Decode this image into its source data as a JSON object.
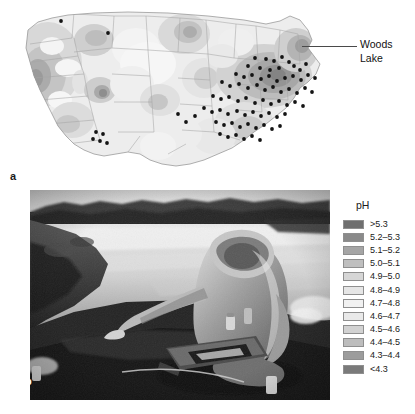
{
  "figure": {
    "panels": [
      {
        "id": "a",
        "label": "a",
        "kind": "map"
      },
      {
        "id": "b",
        "label": "b",
        "kind": "photograph"
      }
    ]
  },
  "map": {
    "title": "",
    "region": "Contiguous United States",
    "annotation": {
      "text": "Woods\nLake",
      "leader": "line"
    },
    "site_marker_color": "#111111",
    "outline_color": "#9a9a9a",
    "state_border_color": "#aaaaaa"
  },
  "photo": {
    "alt": "Researcher kneeling at a lake shore sampling water with a field kit",
    "label": "b"
  },
  "legend": {
    "title": "pH",
    "entries": [
      {
        "label": ">5.3",
        "color": "#6f6f6f"
      },
      {
        "label": "5.2–5.3",
        "color": "#8a8a8a"
      },
      {
        "label": "5.1–5.2",
        "color": "#a5a5a5"
      },
      {
        "label": "5.0–5.1",
        "color": "#bfbfbf"
      },
      {
        "label": "4.9–5.0",
        "color": "#d6d6d6"
      },
      {
        "label": "4.8–4.9",
        "color": "#e6e6e6"
      },
      {
        "label": "4.7–4.8",
        "color": "#f1f1f1"
      },
      {
        "label": "4.6–4.7",
        "color": "#e9e9e9"
      },
      {
        "label": "4.5–4.6",
        "color": "#d2d2d2"
      },
      {
        "label": "4.4–4.5",
        "color": "#bdbdbd"
      },
      {
        "label": "4.3–4.4",
        "color": "#9c9c9c"
      },
      {
        "label": "<4.3",
        "color": "#7a7a7a"
      }
    ]
  },
  "chart_data": {
    "type": "heatmap",
    "title": "",
    "subtitle": "",
    "xlabel": "",
    "ylabel": "",
    "variable": "pH",
    "units": "pH units",
    "legend_position": "right",
    "grid": false,
    "class_breaks": [
      ">5.3",
      "5.2-5.3",
      "5.1-5.2",
      "5.0-5.1",
      "4.9-5.0",
      "4.8-4.9",
      "4.7-4.8",
      "4.6-4.7",
      "4.5-4.6",
      "4.4-4.5",
      "4.3-4.4",
      "<4.3"
    ],
    "class_colors": [
      "#6f6f6f",
      "#8a8a8a",
      "#a5a5a5",
      "#bfbfbf",
      "#d6d6d6",
      "#e6e6e6",
      "#f1f1f1",
      "#e9e9e9",
      "#d2d2d2",
      "#bdbdbd",
      "#9c9c9c",
      "#7a7a7a"
    ],
    "annotations": [
      {
        "text": "Woods Lake",
        "x": 268,
        "y": 50
      }
    ],
    "site_points": [
      [
        53,
        17
      ],
      [
        100,
        29
      ],
      [
        247,
        54
      ],
      [
        258,
        55
      ],
      [
        266,
        57
      ],
      [
        274,
        53
      ],
      [
        281,
        58
      ],
      [
        240,
        62
      ],
      [
        252,
        64
      ],
      [
        262,
        66
      ],
      [
        271,
        64
      ],
      [
        286,
        62
      ],
      [
        292,
        66
      ],
      [
        298,
        60
      ],
      [
        228,
        70
      ],
      [
        236,
        73
      ],
      [
        244,
        71
      ],
      [
        253,
        75
      ],
      [
        261,
        72
      ],
      [
        269,
        77
      ],
      [
        277,
        74
      ],
      [
        285,
        72
      ],
      [
        293,
        76
      ],
      [
        300,
        71
      ],
      [
        307,
        74
      ],
      [
        214,
        78
      ],
      [
        222,
        82
      ],
      [
        231,
        80
      ],
      [
        240,
        84
      ],
      [
        249,
        81
      ],
      [
        257,
        86
      ],
      [
        265,
        83
      ],
      [
        273,
        88
      ],
      [
        281,
        85
      ],
      [
        289,
        89
      ],
      [
        297,
        84
      ],
      [
        304,
        88
      ],
      [
        205,
        92
      ],
      [
        213,
        95
      ],
      [
        221,
        93
      ],
      [
        230,
        97
      ],
      [
        238,
        94
      ],
      [
        247,
        99
      ],
      [
        255,
        96
      ],
      [
        263,
        100
      ],
      [
        271,
        97
      ],
      [
        279,
        101
      ],
      [
        287,
        98
      ],
      [
        295,
        102
      ],
      [
        196,
        104
      ],
      [
        204,
        108
      ],
      [
        212,
        106
      ],
      [
        220,
        110
      ],
      [
        229,
        107
      ],
      [
        237,
        111
      ],
      [
        245,
        108
      ],
      [
        253,
        112
      ],
      [
        261,
        109
      ],
      [
        269,
        113
      ],
      [
        277,
        110
      ],
      [
        208,
        118
      ],
      [
        216,
        121
      ],
      [
        224,
        119
      ],
      [
        232,
        123
      ],
      [
        240,
        120
      ],
      [
        248,
        124
      ],
      [
        256,
        121
      ],
      [
        264,
        125
      ],
      [
        272,
        122
      ],
      [
        212,
        130
      ],
      [
        220,
        133
      ],
      [
        228,
        131
      ],
      [
        236,
        135
      ],
      [
        244,
        132
      ],
      [
        252,
        136
      ],
      [
        88,
        128
      ],
      [
        95,
        130
      ],
      [
        92,
        137
      ],
      [
        99,
        139
      ],
      [
        85,
        135
      ],
      [
        187,
        112
      ],
      [
        178,
        118
      ],
      [
        170,
        110
      ]
    ]
  }
}
